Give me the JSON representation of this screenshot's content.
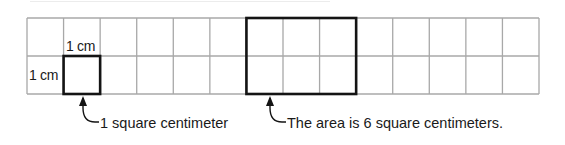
{
  "diagram": {
    "type": "area-grid",
    "grid": {
      "columns": 14,
      "rows": 2,
      "cell_unit": "1 cm",
      "line_color": "#a8a8a8"
    },
    "unit_square": {
      "col": 1,
      "row": 1,
      "width_cells": 1,
      "height_cells": 1,
      "top_label": "1 cm",
      "side_label": "1 cm",
      "annotation": "1 square centimeter"
    },
    "area_rectangle": {
      "col": 6,
      "row": 0,
      "width_cells": 3,
      "height_cells": 2,
      "area": 6,
      "annotation": "The area is 6 square centimeters."
    },
    "highlight_color": "#141414"
  }
}
